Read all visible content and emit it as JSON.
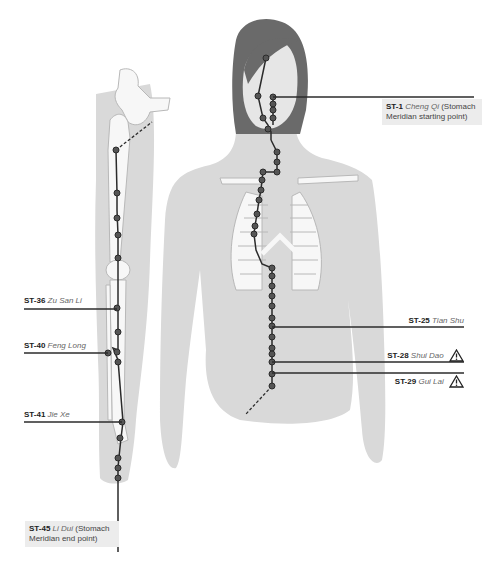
{
  "diagram": {
    "colors": {
      "silhouette": "#d9d9d9",
      "bone": "#f7f7f7",
      "bone_outline": "#b8b8b8",
      "hair": "#6a6a6a",
      "meridian_line": "#2b2b2b",
      "point_fill": "#555555",
      "label_box": "#ececec"
    },
    "labels": [
      {
        "id": "ST-1",
        "code": "ST-1",
        "name": "Cheng Qi",
        "note": "(Stomach Meridian starting point)",
        "warning": false
      },
      {
        "id": "ST-25",
        "code": "ST-25",
        "name": "Tian Shu",
        "note": "",
        "warning": false
      },
      {
        "id": "ST-28",
        "code": "ST-28",
        "name": "Shui Dao",
        "note": "",
        "warning": true
      },
      {
        "id": "ST-29",
        "code": "ST-29",
        "name": "Gui Lai",
        "note": "",
        "warning": true
      },
      {
        "id": "ST-36",
        "code": "ST-36",
        "name": "Zu San Li",
        "note": "",
        "warning": false
      },
      {
        "id": "ST-40",
        "code": "ST-40",
        "name": "Feng Long",
        "note": "",
        "warning": false
      },
      {
        "id": "ST-41",
        "code": "ST-41",
        "name": "Jie Xe",
        "note": "",
        "warning": false
      },
      {
        "id": "ST-45",
        "code": "ST-45",
        "name": "Li Dui",
        "note": "(Stomach Meridian end point)",
        "warning": false
      }
    ],
    "icons": {
      "warning": "warning-triangle-icon"
    }
  }
}
